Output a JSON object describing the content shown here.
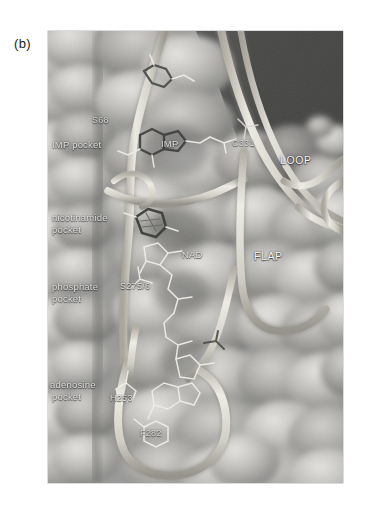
{
  "figure": {
    "panel_label": "(b)",
    "caption_text": "",
    "background_color": "#ffffff",
    "frame": {
      "x": 48,
      "y": 31,
      "width": 295,
      "height": 452,
      "surface_color": "#9b9b9b",
      "dark_background_color": "#4a4a4a",
      "ribbon_color": "#d9d6cf"
    }
  },
  "annotations": {
    "pockets": [
      {
        "id": "imp-pocket",
        "text": "IMP pocket",
        "x": 4,
        "y": 113,
        "style": "dim"
      },
      {
        "id": "nicotinamide-pocket",
        "text": "nicotinamide",
        "x": 4,
        "y": 186,
        "style": "dim"
      },
      {
        "id": "nicotinamide-pocket-2",
        "text": "pocket",
        "x": 4,
        "y": 198,
        "style": "dim"
      },
      {
        "id": "phosphate-pocket",
        "text": "phosphate",
        "x": 4,
        "y": 253,
        "style": "dim"
      },
      {
        "id": "phosphate-pocket-2",
        "text": "pocket",
        "x": 4,
        "y": 265,
        "style": "dim"
      },
      {
        "id": "adenosine-pocket",
        "text": "adenosine",
        "x": 2,
        "y": 351,
        "style": "dim"
      },
      {
        "id": "adenosine-pocket-2",
        "text": "pocket",
        "x": 4,
        "y": 363,
        "style": "dim"
      }
    ],
    "residues": [
      {
        "id": "s68",
        "text": "S68",
        "x": 44,
        "y": 88,
        "style": "faint"
      },
      {
        "id": "c331",
        "text": "C331",
        "x": 184,
        "y": 111,
        "style": "faint"
      },
      {
        "id": "s275-6",
        "text": "S275/6",
        "x": 72,
        "y": 254,
        "style": "dim"
      },
      {
        "id": "h253",
        "text": "H253",
        "x": 62,
        "y": 365,
        "style": "dim"
      },
      {
        "id": "f282",
        "text": "F282",
        "x": 92,
        "y": 400,
        "style": "faint"
      }
    ],
    "ligands": [
      {
        "id": "imp",
        "text": "IMP",
        "x": 113,
        "y": 111,
        "style": "dim"
      },
      {
        "id": "nad",
        "text": "NAD",
        "x": 134,
        "y": 222,
        "style": "dim"
      }
    ],
    "structural": [
      {
        "id": "loop",
        "text": "LOOP",
        "x": 232,
        "y": 128,
        "style": "big"
      },
      {
        "id": "flap",
        "text": "FLAP",
        "x": 206,
        "y": 224,
        "style": "big"
      }
    ]
  },
  "scene": {
    "description": "Molecular surface rendering of an enzyme active site cleft with tube-backbone ribbons and stick-model ligands",
    "surface_tone_light": "#c9c9c7",
    "surface_tone_mid": "#9d9d9b",
    "surface_tone_dark": "#6f6f6e",
    "ribbon_tone": "#dcd9d2",
    "stick_tone": "#efeee9"
  }
}
